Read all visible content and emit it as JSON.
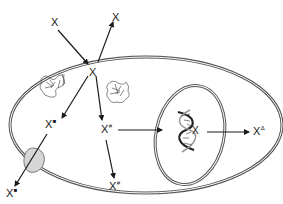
{
  "diagram": {
    "type": "cell-pathway",
    "colors": {
      "membrane": "#555555",
      "arrow": "#1a1a1a",
      "protein": "#7a7a7a",
      "transporter": "#d6d6d6",
      "background": "#ffffff"
    },
    "labels": {
      "x_outside_in": {
        "base": "X",
        "sup": ""
      },
      "x_outside_out": {
        "base": "X",
        "sup": ""
      },
      "x_center": {
        "base": "X",
        "sup": ""
      },
      "x_square_inside": {
        "base": "X",
        "sup": "■"
      },
      "x_square_outside": {
        "base": "X",
        "sup": "■"
      },
      "x_hash_mid": {
        "base": "X",
        "sup": "#"
      },
      "x_hash_membrane": {
        "base": "X",
        "sup": "#"
      },
      "x_dna": {
        "base": "X",
        "sup": ""
      },
      "x_delta": {
        "base": "X",
        "sup": "Δ"
      }
    },
    "elements": {
      "cell_membrane": "outer cell membrane (ellipse)",
      "nucleus": "nucleus (inner ellipse)",
      "protein_left": "enzyme protein structure",
      "protein_right": "enzyme protein structure",
      "dna": "DNA double helix",
      "transporter": "membrane transporter"
    }
  }
}
